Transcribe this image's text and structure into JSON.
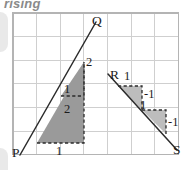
{
  "heading": {
    "text": "rising"
  },
  "figure": {
    "name": "gradient-of-lines-grid-diagram",
    "grid": {
      "x0": 13,
      "y0": 13,
      "cell": 23.6,
      "cols": 7,
      "rows": 6,
      "line_color": "#cfcfcf",
      "border_color": "#b4b4b4",
      "background": "#ffffff"
    },
    "colors": {
      "line": "#2b2b2b",
      "dashed": "#2b2b2b",
      "triangle_dark": "#9a9a9a",
      "triangle_light": "#bdbdbd",
      "label": "#1c1c1c"
    },
    "lines": [
      {
        "name": "line-PQ",
        "from_label": "P",
        "to_label": "Q",
        "from": [
          20,
          155
        ],
        "to": [
          96,
          22
        ],
        "gradient": 2,
        "description": "rising line through P and Q"
      },
      {
        "name": "line-RS",
        "from_label": "R",
        "to_label": "S",
        "from": [
          108,
          74
        ],
        "to": [
          177,
          150
        ],
        "gradient": -1,
        "description": "falling line through R and S"
      }
    ],
    "point_labels": [
      {
        "name": "point-label-P",
        "text": "P",
        "x": 12,
        "y": 146
      },
      {
        "name": "point-label-Q",
        "text": "Q",
        "x": 92,
        "y": 14
      },
      {
        "name": "point-label-R",
        "text": "R",
        "x": 110,
        "y": 68
      },
      {
        "name": "point-label-S",
        "text": "S",
        "x": 173,
        "y": 143
      }
    ],
    "step_triangles": [
      {
        "name": "step-triangle-pq-lower",
        "shade": "dark",
        "points": "37,143 84,143 84,62",
        "run_label": "1",
        "rise_label": "2"
      },
      {
        "name": "step-triangle-pq-upper",
        "shade": "dark",
        "points": "61,96 84,96 84,62",
        "run_label": "1",
        "rise_label": "2"
      },
      {
        "name": "step-triangle-rs-first",
        "shade": "light",
        "points": "118,86 142,86 142,110",
        "run_label": "1",
        "rise_label": "-1"
      },
      {
        "name": "step-triangle-rs-second",
        "shade": "light",
        "points": "142,110 166,110 166,134",
        "run_label": "1",
        "rise_label": "-1"
      }
    ],
    "measure_labels": [
      {
        "name": "measure-label-pq-rise-upper",
        "text": "2",
        "x": 86,
        "y": 56
      },
      {
        "name": "measure-label-pq-run-upper",
        "text": "1",
        "x": 64,
        "y": 83
      },
      {
        "name": "measure-label-pq-rise-lower",
        "text": "2",
        "x": 64,
        "y": 103
      },
      {
        "name": "measure-label-pq-run-lower",
        "text": "1",
        "x": 56,
        "y": 145
      },
      {
        "name": "measure-label-rs-run-first",
        "text": "1",
        "x": 124,
        "y": 70
      },
      {
        "name": "measure-label-rs-rise-first",
        "text": "-1",
        "x": 144,
        "y": 88
      },
      {
        "name": "measure-label-rs-run-second",
        "text": "1",
        "x": 140,
        "y": 99
      },
      {
        "name": "measure-label-rs-rise-second",
        "text": "-1",
        "x": 168,
        "y": 116
      }
    ]
  }
}
